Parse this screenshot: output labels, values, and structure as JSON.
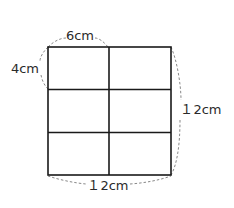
{
  "figure": {
    "grid": {
      "columns": 2,
      "rows": 3
    },
    "labels": {
      "cell_width": "6cm",
      "cell_height": "4cm",
      "total_height": "１2cm",
      "total_width": "１2cm"
    },
    "colors": {
      "line": "#1a1a1a",
      "dash": "#888888",
      "text": "#2a2a2a"
    }
  }
}
